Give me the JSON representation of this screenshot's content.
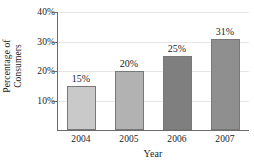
{
  "chart_data": {
    "type": "bar",
    "title": "",
    "subtitle": "",
    "xlabel": "Year",
    "ylabel": "Percentage of Consumers",
    "ylabel_line1": "Percentage of",
    "ylabel_line2": "Consumers",
    "categories": [
      "2004",
      "2005",
      "2006",
      "2007"
    ],
    "values": [
      15,
      20,
      25,
      31
    ],
    "value_labels": [
      "15%",
      "20%",
      "25%",
      "31%"
    ],
    "ylim": [
      0,
      40
    ],
    "y_ticks": [
      10,
      20,
      30,
      40
    ],
    "y_tick_labels": [
      "10%",
      "20%",
      "30%",
      "40%"
    ],
    "grid": true,
    "grid_axis": "y",
    "legend": false,
    "legend_position": "none",
    "bar_colors": [
      "#c9c9c9",
      "#b2b2b2",
      "#7f7f7f",
      "#8f8f8f"
    ],
    "bar_edge_color": "#787878",
    "axis_color": "#6b6b6b",
    "grid_color": "#e6e6e6",
    "text_color": "#1c1c1c",
    "background": "#ffffff"
  }
}
